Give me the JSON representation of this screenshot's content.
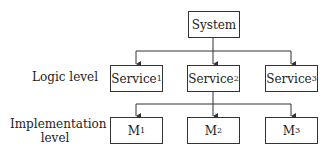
{
  "diagram": {
    "root": {
      "label": "System"
    },
    "levels": [
      {
        "label": "Logic level"
      },
      {
        "label_line1": "Implementation",
        "label_line2": "level"
      }
    ],
    "services": [
      {
        "base": "Service",
        "sub": "1"
      },
      {
        "base": "Service",
        "sub": "2"
      },
      {
        "base": "Service",
        "sub": "3"
      }
    ],
    "modules": [
      {
        "base": "M",
        "sub": "1"
      },
      {
        "base": "M",
        "sub": "2"
      },
      {
        "base": "M",
        "sub": "3"
      }
    ],
    "edges": [
      [
        "System",
        "Service1"
      ],
      [
        "System",
        "Service2"
      ],
      [
        "System",
        "Service3"
      ],
      [
        "Service2",
        "M1"
      ],
      [
        "Service2",
        "M2"
      ],
      [
        "Service2",
        "M3"
      ]
    ]
  }
}
